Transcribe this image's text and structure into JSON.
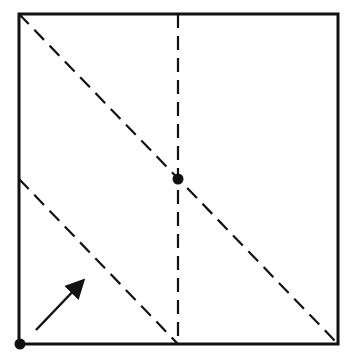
{
  "diagram": {
    "type": "geometric-fold-diagram",
    "canvas": {
      "width": 349,
      "height": 358
    },
    "colors": {
      "stroke": "#111111",
      "background": "#ffffff"
    },
    "square": {
      "x1": 19,
      "y1": 14,
      "x2": 338,
      "y2": 344
    },
    "dashed_lines": [
      {
        "name": "main-diagonal",
        "x1": 19,
        "y1": 14,
        "x2": 338,
        "y2": 344
      },
      {
        "name": "vertical-center",
        "x1": 178,
        "y1": 14,
        "x2": 178,
        "y2": 344
      },
      {
        "name": "lower-diagonal",
        "x1": 19,
        "y1": 179,
        "x2": 178,
        "y2": 344
      }
    ],
    "points": [
      {
        "name": "center-point",
        "x": 178,
        "y": 179
      },
      {
        "name": "bottom-left-corner-point",
        "x": 20,
        "y": 344
      }
    ],
    "arrow": {
      "x1": 36,
      "y1": 330,
      "x2": 80,
      "y2": 284
    }
  }
}
